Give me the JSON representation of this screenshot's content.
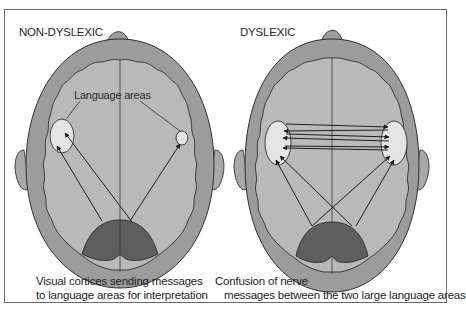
{
  "panels": [
    {
      "id": "non-dyslexic",
      "title": "NON-DYSLEXIC",
      "callout_label": "Language areas",
      "caption_lines": [
        "Visual cortices sending messages",
        "to language areas for interpretation"
      ]
    },
    {
      "id": "dyslexic",
      "title": "DYSLEXIC",
      "caption_lines": [
        "Confusion of nerve",
        "messages between the two large language  areas"
      ]
    }
  ],
  "colors": {
    "skull": "#9c9c9c",
    "brain": "#b9b9b9",
    "language_area": "#e4e4e4",
    "visual_cortex": "#5e5e5e",
    "outline": "#2e2e2e",
    "frame": "#6a6a6a"
  }
}
